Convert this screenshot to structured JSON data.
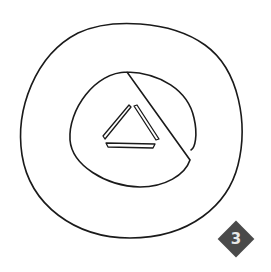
{
  "drawing": {
    "description": "Hand-drawn sketch of two concentric circles with a triangle in the center",
    "shapes": [
      "outer-circle",
      "inner-circle",
      "triangle"
    ],
    "stroke_color": "#1a1a1a"
  },
  "badge": {
    "label": "3",
    "color": "#4a4a4a",
    "text_color": "#e8e8e8"
  }
}
